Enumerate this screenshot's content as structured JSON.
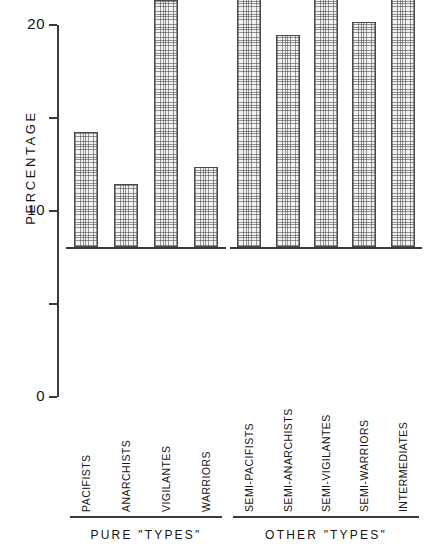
{
  "chart_data": {
    "type": "bar",
    "title": "",
    "xlabel": "",
    "ylabel": "PERCENTAGE",
    "ylim": [
      0,
      20
    ],
    "grid": false,
    "legend": "none",
    "y_ticks": [
      {
        "value": 20,
        "label": "20"
      },
      {
        "value": 15,
        "label": ""
      },
      {
        "value": 10,
        "label": "10"
      },
      {
        "value": 5,
        "label": ""
      },
      {
        "value": 0,
        "label": "0"
      }
    ],
    "groups": [
      {
        "name": "PURE \"TYPES\"",
        "categories": [
          "PACIFISTS",
          "ANARCHISTS",
          "VIGILANTES",
          "WARRIORS"
        ],
        "values": [
          6.2,
          3.4,
          13.3,
          4.3
        ]
      },
      {
        "name": "OTHER \"TYPES\"",
        "categories": [
          "SEMI-PACIFISTS",
          "SEMI-ANARCHISTS",
          "SEMI-VIGILANTES",
          "SEMI-WARRIORS",
          "INTERMEDIATES"
        ],
        "values": [
          19.3,
          11.4,
          16.3,
          12.1,
          16.3
        ]
      }
    ],
    "categories": [
      "PACIFISTS",
      "ANARCHISTS",
      "VIGILANTES",
      "WARRIORS",
      "SEMI-PACIFISTS",
      "SEMI-ANARCHISTS",
      "SEMI-VIGILANTES",
      "SEMI-WARRIORS",
      "INTERMEDIATES"
    ],
    "values": [
      6.2,
      3.4,
      13.3,
      4.3,
      19.3,
      11.4,
      16.3,
      12.1,
      16.3
    ],
    "colors": {
      "axis": "#3a3a3a",
      "bar_outline": "#4a4a4a",
      "bar_fill": "#f2f2f2",
      "bar_hatch": "#464646",
      "text": "#141414",
      "background": "#ffffff"
    }
  }
}
